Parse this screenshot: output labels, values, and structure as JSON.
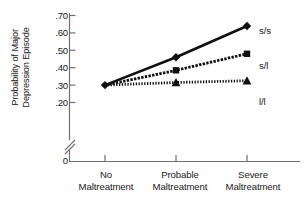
{
  "chart_data": {
    "type": "line",
    "title": "",
    "subtitle": "",
    "xlabel": "",
    "ylabel": "Probability of Major Depression Episode",
    "ylabel_lines": [
      "Probability of Major",
      "Depression Episode"
    ],
    "categories": [
      "No Maltreatment",
      "Probable Maltreatment",
      "Severe Maltreatment"
    ],
    "category_lines": [
      [
        "No",
        "Maltreatment"
      ],
      [
        "Probable",
        "Maltreatment"
      ],
      [
        "Severe",
        "Maltreatment"
      ]
    ],
    "ylim": [
      0.2,
      0.7
    ],
    "yticks": [
      0.2,
      0.3,
      0.4,
      0.5,
      0.6,
      0.7
    ],
    "ytick_labels": [
      ".20",
      ".30",
      ".40",
      ".50",
      ".60",
      ".70"
    ],
    "y_origin_label": "0",
    "axis_break": true,
    "grid": false,
    "legend_position": "right-inline",
    "series": [
      {
        "name": "s/s",
        "label": "s/s",
        "marker": "diamond",
        "line_style": "solid",
        "color": "#101010",
        "values": [
          0.3,
          0.46,
          0.64
        ]
      },
      {
        "name": "s/l",
        "label": "s/l",
        "marker": "square",
        "line_style": "dashed",
        "color": "#101010",
        "values": [
          0.3,
          0.385,
          0.48
        ]
      },
      {
        "name": "l/l",
        "label": "l/l",
        "marker": "triangle",
        "line_style": "dotted",
        "color": "#101010",
        "values": [
          0.3,
          0.315,
          0.325
        ]
      }
    ]
  },
  "axis": {
    "tick_0": ".70",
    "tick_1": ".60",
    "tick_2": ".50",
    "tick_3": ".40",
    "tick_4": ".30",
    "tick_5": ".20",
    "zero": "0"
  },
  "xlabels": {
    "c0_line0": "No",
    "c0_line1": "Maltreatment",
    "c1_line0": "Probable",
    "c1_line1": "Maltreatment",
    "c2_line0": "Severe",
    "c2_line1": "Maltreatment"
  },
  "ylabel": {
    "line0": "Probability of Major",
    "line1": "Depression Episode"
  },
  "legend": {
    "ss": "s/s",
    "sl": "s/l",
    "ll": "l/l"
  }
}
